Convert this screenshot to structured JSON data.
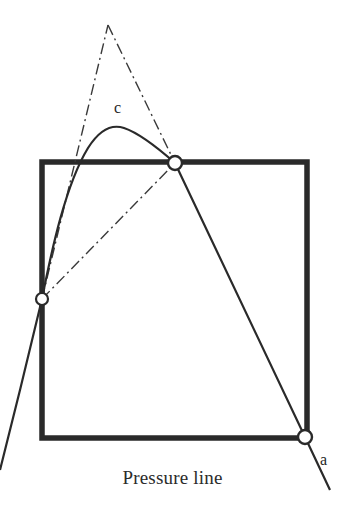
{
  "figure": {
    "caption": "Pressure line",
    "labels": {
      "crown": "c",
      "abutment": "a"
    },
    "colors": {
      "ink": "#2a2a2a",
      "caption_ink": "#2b2b2b",
      "node_fill": "#ffffff",
      "background": "#ffffff"
    }
  },
  "chart_data": {
    "type": "line",
    "title": "",
    "subtitle": "",
    "xlabel": "Pressure line",
    "ylabel": "",
    "xlim": [
      0,
      345
    ],
    "ylim": [
      0,
      529
    ],
    "grid": false,
    "legend": null,
    "annotations": [
      {
        "text": "c",
        "x": 120,
        "y": 110,
        "describes": "crown of the solid pressure-line arch"
      },
      {
        "text": "a",
        "x": 325,
        "y": 462,
        "describes": "springing point on the right abutment"
      },
      {
        "text": "Pressure line",
        "x": 172,
        "y": 480,
        "describes": "figure caption"
      }
    ],
    "series": [
      {
        "name": "masonry-block-outline",
        "style": "solid-thick",
        "closed": true,
        "points": [
          [
            42,
            162
          ],
          [
            307,
            162
          ],
          [
            307,
            438
          ],
          [
            42,
            438
          ]
        ]
      },
      {
        "name": "pressure-line-arch",
        "style": "solid",
        "closed": false,
        "points": [
          [
            42,
            299
          ],
          [
            60,
            200
          ],
          [
            80,
            155
          ],
          [
            100,
            134
          ],
          [
            120,
            127
          ],
          [
            140,
            132
          ],
          [
            158,
            146
          ],
          [
            175,
            163
          ]
        ]
      },
      {
        "name": "pressure-line-right-descent",
        "style": "solid",
        "closed": false,
        "points": [
          [
            175,
            163
          ],
          [
            305,
            437
          ],
          [
            330,
            490
          ]
        ]
      },
      {
        "name": "pressure-line-left-descent",
        "style": "solid",
        "closed": false,
        "points": [
          [
            42,
            299
          ],
          [
            20,
            390
          ],
          [
            0,
            470
          ]
        ]
      },
      {
        "name": "thrust-chord-left-leg",
        "style": "dash-dot",
        "closed": false,
        "points": [
          [
            42,
            299
          ],
          [
            108,
            25
          ]
        ]
      },
      {
        "name": "thrust-chord-right-leg",
        "style": "dash-dot",
        "closed": false,
        "points": [
          [
            108,
            25
          ],
          [
            175,
            163
          ]
        ]
      },
      {
        "name": "thrust-chord-base",
        "style": "dash-dot",
        "closed": false,
        "points": [
          [
            42,
            299
          ],
          [
            175,
            163
          ]
        ]
      }
    ],
    "nodes": [
      {
        "name": "left-springing-node",
        "x": 42,
        "y": 299,
        "r": 6
      },
      {
        "name": "crown-node",
        "x": 175,
        "y": 163,
        "r": 7
      },
      {
        "name": "right-springing-node",
        "x": 305,
        "y": 437,
        "r": 7
      }
    ]
  }
}
